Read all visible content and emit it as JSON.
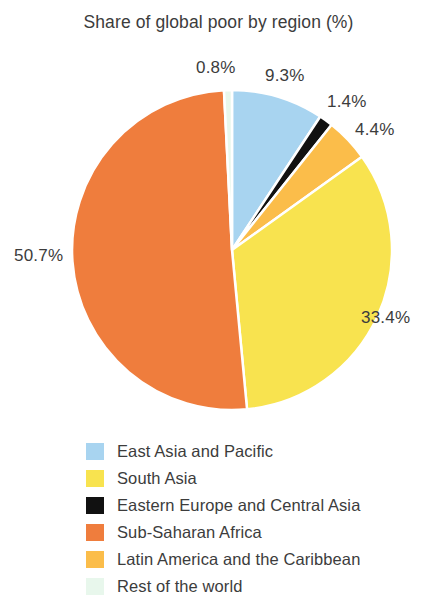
{
  "chart_data": {
    "type": "pie",
    "title": "Share of global poor by region (%)",
    "xlabel": "",
    "ylabel": "",
    "legend_position": "bottom-left",
    "grid": false,
    "units": "%",
    "start_angle_deg": 0,
    "direction": "clockwise",
    "categories": [
      "East Asia and Pacific",
      "South Asia",
      "Eastern Europe and Central Asia",
      "Sub-Saharan Africa",
      "Latin America and the Caribbean",
      "Rest of the world"
    ],
    "values": [
      9.3,
      33.4,
      1.4,
      50.7,
      4.4,
      0.8
    ],
    "colors": [
      "#a8d4f0",
      "#f8e34f",
      "#111111",
      "#ef7d3d",
      "#fbbd4a",
      "#e8f7ec"
    ],
    "slices": [
      {
        "label": "East Asia and Pacific",
        "value": 9.3,
        "display": "9.3%",
        "color": "#a8d4f0"
      },
      {
        "label": "Eastern Europe and Central Asia",
        "value": 1.4,
        "display": "1.4%",
        "color": "#111111"
      },
      {
        "label": "Latin America and the Caribbean",
        "value": 4.4,
        "display": "4.4%",
        "color": "#fbbd4a"
      },
      {
        "label": "South Asia",
        "value": 33.4,
        "display": "33.4%",
        "color": "#f8e34f"
      },
      {
        "label": "Sub-Saharan Africa",
        "value": 50.7,
        "display": "50.7%",
        "color": "#ef7d3d"
      },
      {
        "label": "Rest of the world",
        "value": 0.8,
        "display": "0.8%",
        "color": "#e8f7ec"
      }
    ]
  },
  "title": "Share of global poor by region (%)",
  "value_labels": {
    "rest_of_world": "0.8%",
    "east_asia": "9.3%",
    "eastern_europe": "1.4%",
    "latin_america": "4.4%",
    "south_asia": "33.4%",
    "sub_saharan_africa": "50.7%"
  },
  "legend": {
    "items": [
      {
        "label": "East Asia and Pacific",
        "color": "#a8d4f0"
      },
      {
        "label": "South Asia",
        "color": "#f8e34f"
      },
      {
        "label": "Eastern Europe and Central Asia",
        "color": "#111111"
      },
      {
        "label": "Sub-Saharan Africa",
        "color": "#ef7d3d"
      },
      {
        "label": "Latin America and the Caribbean",
        "color": "#fbbd4a"
      },
      {
        "label": "Rest of the world",
        "color": "#e8f7ec"
      }
    ]
  }
}
